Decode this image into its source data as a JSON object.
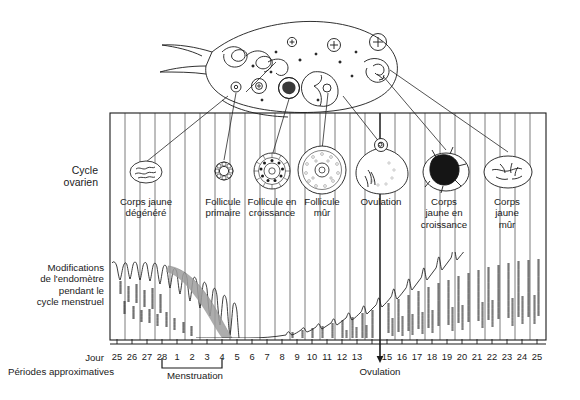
{
  "figure": {
    "language": "fr",
    "title_implicit": "Cycle ovarien et modifications de l'endomètre",
    "ink_color": "#1a1a1a",
    "band_color": "#9a9a9a",
    "background": "#ffffff"
  },
  "side_labels": {
    "ovarian_cycle": "Cycle\novarien",
    "endometrium": "Modifications\nde l'endomètre\npendant le\ncycle menstruel",
    "day_label": "Jour",
    "periods_label": "Périodes approximatives"
  },
  "ovarian_stages": [
    {
      "id": "corps-jaune-degenere",
      "label": "Corps jaune\ndégénéré",
      "x": 143,
      "day": 27,
      "icon": "degenerating-corpus-luteum"
    },
    {
      "id": "follicule-primaire",
      "label": "Follicule\nprimaire",
      "x": 222,
      "day": 6,
      "icon": "primary-follicle"
    },
    {
      "id": "follicule-croissance",
      "label": "Follicule en\ncroissance",
      "x": 271,
      "day": 9,
      "icon": "growing-follicle"
    },
    {
      "id": "follicule-mur",
      "label": "Follicule\nmûr",
      "x": 322,
      "day": 12,
      "icon": "mature-follicle"
    },
    {
      "id": "ovulation-stage",
      "label": "Ovulation",
      "x": 381,
      "day": 14,
      "icon": "ovulating-follicle"
    },
    {
      "id": "corps-jaune-croissance",
      "label": "Corps\njaune en\ncroissance",
      "x": 443,
      "day": 18,
      "icon": "growing-corpus-luteum"
    },
    {
      "id": "corps-jaune-mur",
      "label": "Corps\njaune\nmûr",
      "x": 507,
      "day": 22,
      "icon": "mature-corpus-luteum"
    }
  ],
  "axis": {
    "day_ticks": [
      "25",
      "26",
      "27",
      "28",
      "1",
      "2",
      "3",
      "4",
      "5",
      "6",
      "7",
      "8",
      "9",
      "10",
      "11",
      "12",
      "13",
      "14",
      "15",
      "16",
      "17",
      "18",
      "19",
      "20",
      "21",
      "22",
      "23",
      "24",
      "25"
    ],
    "hidden_tick_index": 17,
    "menstruation": {
      "label": "Menstruation",
      "from_day": "28",
      "to_day": "4"
    },
    "ovulation": {
      "label": "Ovulation",
      "at_day": "14"
    }
  },
  "chart_data": {
    "type": "area",
    "title": "Modifications de l'endomètre pendant le cycle menstruel",
    "xlabel": "Jour",
    "ylabel": "Épaisseur de l'endomètre",
    "grid": true,
    "legend": "none",
    "categories": [
      "25",
      "26",
      "27",
      "28",
      "1",
      "2",
      "3",
      "4",
      "5",
      "6",
      "7",
      "8",
      "9",
      "10",
      "11",
      "12",
      "13",
      "14",
      "15",
      "16",
      "17",
      "18",
      "19",
      "20",
      "21",
      "22",
      "23",
      "24",
      "25"
    ],
    "series": [
      {
        "name": "Épaisseur de l'endomètre (relative)",
        "values": [
          98,
          96,
          94,
          92,
          70,
          52,
          34,
          16,
          6,
          9,
          13,
          17,
          21,
          26,
          31,
          36,
          41,
          46,
          53,
          59,
          65,
          70,
          76,
          81,
          86,
          90,
          94,
          97,
          99
        ]
      }
    ],
    "annotations": [
      {
        "text": "Menstruation",
        "from": "28",
        "to": "4",
        "type": "bracket"
      },
      {
        "text": "Ovulation",
        "at": "14",
        "type": "arrow"
      },
      {
        "text": "desquamation (bande grise)",
        "from": "27",
        "to": "4",
        "type": "shaded-band"
      }
    ],
    "ylim": [
      0,
      100
    ]
  }
}
